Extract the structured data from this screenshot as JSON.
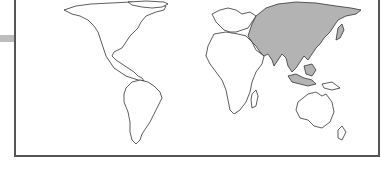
{
  "map": {
    "type": "world-choropleth",
    "highlighted_region": "Asia",
    "colors": {
      "highlight_fill": "#b3b3b3",
      "land_fill": "#ffffff",
      "outline": "#333333",
      "frame_border": "#555555",
      "side_tab": "#bdbdbd"
    },
    "regions": [
      {
        "name": "North America",
        "highlighted": false
      },
      {
        "name": "South America",
        "highlighted": false
      },
      {
        "name": "Europe",
        "highlighted": false
      },
      {
        "name": "Africa",
        "highlighted": false
      },
      {
        "name": "Asia",
        "highlighted": true
      },
      {
        "name": "Oceania",
        "highlighted": false
      }
    ]
  }
}
